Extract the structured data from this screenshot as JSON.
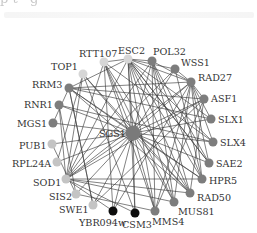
{
  "header": {
    "cut_text": "p          t       ·         g     "
  },
  "graph": {
    "center": {
      "id": "SGS1",
      "label": "SGS1",
      "x": 133,
      "y": 133,
      "r": 7.5,
      "color": "#7a7a7a",
      "label_x": 99,
      "label_y": 137
    },
    "nodes": [
      {
        "id": "RTT107",
        "label": "RTT107",
        "x": 104,
        "y": 62,
        "r": 4.5,
        "color": "#d6d6d6",
        "lx": 79,
        "ly": 57,
        "anchor": "start"
      },
      {
        "id": "ESC2",
        "label": "ESC2",
        "x": 128,
        "y": 59,
        "r": 4.5,
        "color": "#d6d6d6",
        "lx": 118,
        "ly": 54,
        "anchor": "start"
      },
      {
        "id": "POL32",
        "label": "POL32",
        "x": 152,
        "y": 61,
        "r": 4.5,
        "color": "#7d7d7d",
        "lx": 153,
        "ly": 55,
        "anchor": "start"
      },
      {
        "id": "WSS1",
        "label": "WSS1",
        "x": 175,
        "y": 69,
        "r": 4.5,
        "color": "#7d7d7d",
        "lx": 181,
        "ly": 66,
        "anchor": "start"
      },
      {
        "id": "RAD27",
        "label": "RAD27",
        "x": 191,
        "y": 82,
        "r": 4.5,
        "color": "#7d7d7d",
        "lx": 198,
        "ly": 81,
        "anchor": "start"
      },
      {
        "id": "ASF1",
        "label": "ASF1",
        "x": 204,
        "y": 99,
        "r": 4.5,
        "color": "#7d7d7d",
        "lx": 211,
        "ly": 102,
        "anchor": "start"
      },
      {
        "id": "SLX1",
        "label": "SLX1",
        "x": 211,
        "y": 119,
        "r": 4.5,
        "color": "#7d7d7d",
        "lx": 218,
        "ly": 123,
        "anchor": "start"
      },
      {
        "id": "SLX4",
        "label": "SLX4",
        "x": 213,
        "y": 142,
        "r": 4.5,
        "color": "#7d7d7d",
        "lx": 220,
        "ly": 146,
        "anchor": "start"
      },
      {
        "id": "SAE2",
        "label": "SAE2",
        "x": 209,
        "y": 163,
        "r": 4.5,
        "color": "#7d7d7d",
        "lx": 216,
        "ly": 167,
        "anchor": "start"
      },
      {
        "id": "HPR5",
        "label": "HPR5",
        "x": 202,
        "y": 179,
        "r": 4.5,
        "color": "#7d7d7d",
        "lx": 209,
        "ly": 184,
        "anchor": "start"
      },
      {
        "id": "RAD50",
        "label": "RAD50",
        "x": 190,
        "y": 193,
        "r": 4.5,
        "color": "#7d7d7d",
        "lx": 197,
        "ly": 201,
        "anchor": "start"
      },
      {
        "id": "MUS81",
        "label": "MUS81",
        "x": 174,
        "y": 202,
        "r": 4.5,
        "color": "#7d7d7d",
        "lx": 178,
        "ly": 215,
        "anchor": "start"
      },
      {
        "id": "MMS4",
        "label": "MMS4",
        "x": 155,
        "y": 211,
        "r": 4.5,
        "color": "#7d7d7d",
        "lx": 152,
        "ly": 225,
        "anchor": "start"
      },
      {
        "id": "CSM3",
        "label": "CSM3",
        "x": 135,
        "y": 213,
        "r": 4.5,
        "color": "#0d0d0d",
        "lx": 122,
        "ly": 228,
        "anchor": "start"
      },
      {
        "id": "YBR094w",
        "label": "YBR094w",
        "x": 113,
        "y": 211,
        "r": 4.5,
        "color": "#0d0d0d",
        "lx": 79,
        "ly": 226,
        "anchor": "start"
      },
      {
        "id": "SWE1",
        "label": "SWE1",
        "x": 93,
        "y": 205,
        "r": 4.5,
        "color": "#c4c4c4",
        "lx": 59,
        "ly": 213,
        "anchor": "start"
      },
      {
        "id": "SIS2",
        "label": "SIS2",
        "x": 76,
        "y": 194,
        "r": 4.5,
        "color": "#c4c4c4",
        "lx": 49,
        "ly": 200,
        "anchor": "start"
      },
      {
        "id": "SOD1",
        "label": "SOD1",
        "x": 66,
        "y": 179,
        "r": 4.5,
        "color": "#c4c4c4",
        "lx": 33,
        "ly": 186,
        "anchor": "start"
      },
      {
        "id": "RPL24A",
        "label": "RPL24A",
        "x": 57,
        "y": 162,
        "r": 4.5,
        "color": "#c4c4c4",
        "lx": 12,
        "ly": 167,
        "anchor": "start"
      },
      {
        "id": "PUB1",
        "label": "PUB1",
        "x": 52,
        "y": 144,
        "r": 4.5,
        "color": "#c4c4c4",
        "lx": 19,
        "ly": 149,
        "anchor": "start"
      },
      {
        "id": "MGS1",
        "label": "MGS1",
        "x": 53,
        "y": 123,
        "r": 4.5,
        "color": "#7d7d7d",
        "lx": 17,
        "ly": 127,
        "anchor": "start"
      },
      {
        "id": "RNR1",
        "label": "RNR1",
        "x": 59,
        "y": 105,
        "r": 4.5,
        "color": "#7d7d7d",
        "lx": 24,
        "ly": 108,
        "anchor": "start"
      },
      {
        "id": "RRM3",
        "label": "RRM3",
        "x": 69,
        "y": 88,
        "r": 4.5,
        "color": "#7d7d7d",
        "lx": 32,
        "ly": 88,
        "anchor": "start"
      },
      {
        "id": "TOP1",
        "label": "TOP1",
        "x": 83,
        "y": 74,
        "r": 4.5,
        "color": "#d6d6d6",
        "lx": 51,
        "ly": 70,
        "anchor": "start"
      }
    ],
    "edges": [
      [
        "SGS1",
        "RTT107"
      ],
      [
        "SGS1",
        "ESC2"
      ],
      [
        "SGS1",
        "POL32"
      ],
      [
        "SGS1",
        "WSS1"
      ],
      [
        "SGS1",
        "RAD27"
      ],
      [
        "SGS1",
        "ASF1"
      ],
      [
        "SGS1",
        "SLX1"
      ],
      [
        "SGS1",
        "SLX4"
      ],
      [
        "SGS1",
        "SAE2"
      ],
      [
        "SGS1",
        "HPR5"
      ],
      [
        "SGS1",
        "RAD50"
      ],
      [
        "SGS1",
        "MUS81"
      ],
      [
        "SGS1",
        "MMS4"
      ],
      [
        "SGS1",
        "CSM3"
      ],
      [
        "SGS1",
        "YBR094w"
      ],
      [
        "SGS1",
        "SWE1"
      ],
      [
        "SGS1",
        "SIS2"
      ],
      [
        "SGS1",
        "SOD1"
      ],
      [
        "SGS1",
        "RPL24A"
      ],
      [
        "SGS1",
        "PUB1"
      ],
      [
        "SGS1",
        "MGS1"
      ],
      [
        "SGS1",
        "RNR1"
      ],
      [
        "SGS1",
        "RRM3"
      ],
      [
        "SGS1",
        "TOP1"
      ],
      [
        "ESC2",
        "RTT107"
      ],
      [
        "ESC2",
        "POL32"
      ],
      [
        "ESC2",
        "WSS1"
      ],
      [
        "ESC2",
        "RAD27"
      ],
      [
        "ESC2",
        "SLX1"
      ],
      [
        "ESC2",
        "SLX4"
      ],
      [
        "ESC2",
        "SAE2"
      ],
      [
        "ESC2",
        "HPR5"
      ],
      [
        "ESC2",
        "MUS81"
      ],
      [
        "ESC2",
        "MMS4"
      ],
      [
        "ESC2",
        "CSM3"
      ],
      [
        "ESC2",
        "RRM3"
      ],
      [
        "ESC2",
        "SOD1"
      ],
      [
        "ESC2",
        "RAD50"
      ],
      [
        "POL32",
        "RAD27"
      ],
      [
        "POL32",
        "HPR5"
      ],
      [
        "POL32",
        "RAD50"
      ],
      [
        "POL32",
        "MUS81"
      ],
      [
        "POL32",
        "MMS4"
      ],
      [
        "POL32",
        "SOD1"
      ],
      [
        "POL32",
        "SAE2"
      ],
      [
        "WSS1",
        "RAD27"
      ],
      [
        "WSS1",
        "SOD1"
      ],
      [
        "WSS1",
        "HPR5"
      ],
      [
        "RAD27",
        "ASF1"
      ],
      [
        "RAD27",
        "SLX1"
      ],
      [
        "RAD27",
        "SLX4"
      ],
      [
        "RAD27",
        "MUS81"
      ],
      [
        "RAD27",
        "MMS4"
      ],
      [
        "RAD27",
        "RRM3"
      ],
      [
        "RAD27",
        "SOD1"
      ],
      [
        "RAD27",
        "YBR094w"
      ],
      [
        "RAD27",
        "SAE2"
      ],
      [
        "RAD27",
        "HPR5"
      ],
      [
        "ASF1",
        "SOD1"
      ],
      [
        "ASF1",
        "SWE1"
      ],
      [
        "ASF1",
        "RRM3"
      ],
      [
        "ASF1",
        "MMS4"
      ],
      [
        "ASF1",
        "RAD50"
      ],
      [
        "SLX1",
        "RRM3"
      ],
      [
        "SLX4",
        "RNR1"
      ],
      [
        "SLX4",
        "RTT107"
      ],
      [
        "SAE2",
        "ESC2"
      ],
      [
        "HPR5",
        "SOD1"
      ],
      [
        "HPR5",
        "RRM3"
      ],
      [
        "RAD50",
        "SOD1"
      ],
      [
        "RAD50",
        "TOP1"
      ],
      [
        "RAD50",
        "RRM3"
      ],
      [
        "MUS81",
        "SOD1"
      ],
      [
        "MUS81",
        "RTT107"
      ],
      [
        "MMS4",
        "RTT107"
      ],
      [
        "MMS4",
        "SIS2"
      ],
      [
        "CSM3",
        "TOP1"
      ],
      [
        "CSM3",
        "SOD1"
      ],
      [
        "YBR094w",
        "RTT107"
      ],
      [
        "YBR094w",
        "SOD1"
      ],
      [
        "SWE1",
        "RRM3"
      ],
      [
        "PUB1",
        "SIS2"
      ],
      [
        "SOD1",
        "RTT107"
      ],
      [
        "SOD1",
        "RNR1"
      ],
      [
        "SOD1",
        "TOP1"
      ],
      [
        "RRM3",
        "SWE1"
      ],
      [
        "RRM3",
        "MGS1"
      ],
      [
        "RNR1",
        "SIS2"
      ],
      [
        "TOP1",
        "RPL24A"
      ],
      [
        "RTT107",
        "RAD50"
      ]
    ]
  }
}
